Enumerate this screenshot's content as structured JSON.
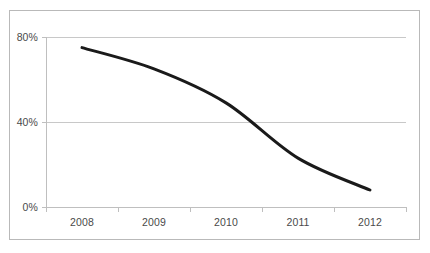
{
  "chart_data": {
    "type": "line",
    "title": "",
    "subtitle": "",
    "xlabel": "",
    "ylabel": "",
    "categories": [
      "2008",
      "2009",
      "2010",
      "2011",
      "2012"
    ],
    "series": [
      {
        "name": "",
        "values": [
          75,
          65,
          49,
          23,
          8
        ],
        "color": "#1a1a1a",
        "line_width": 3,
        "markers": false,
        "smooth": true
      }
    ],
    "ylim": [
      0,
      80
    ],
    "ytick_values": [
      0,
      40,
      80
    ],
    "ytick_labels": [
      "0%",
      "40%",
      "80%"
    ],
    "xtick_labels": [
      "2008",
      "2009",
      "2010",
      "2011",
      "2012"
    ],
    "grid": {
      "horizontal": true,
      "vertical": false,
      "color": "#c8c8c8"
    },
    "legend": {
      "visible": false,
      "position": "none"
    },
    "axis": {
      "y_axis_line": true,
      "x_axis_line": true,
      "color": "#bfbfbf",
      "tick_marks": true
    },
    "border": {
      "visible": true,
      "color": "#b9b9b9"
    },
    "plot_background": "#ffffff"
  },
  "labels": {
    "y": {
      "t0": "0%",
      "t1": "40%",
      "t2": "80%"
    },
    "x": {
      "c0": "2008",
      "c1": "2009",
      "c2": "2010",
      "c3": "2011",
      "c4": "2012"
    }
  }
}
